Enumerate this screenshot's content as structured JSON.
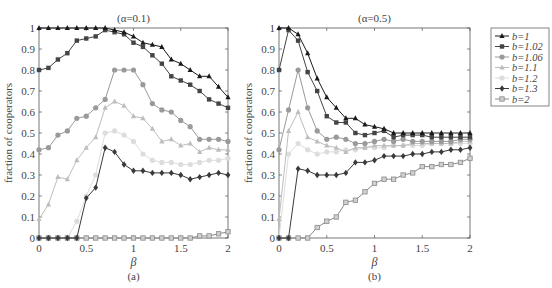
{
  "chart_data": [
    {
      "type": "line",
      "panel_label": "(a)",
      "title": "(α=0.1)",
      "xlabel": "β",
      "ylabel": "fraction of cooperators",
      "xlim": [
        0,
        2
      ],
      "ylim": [
        0,
        1
      ],
      "xticks": [
        "0",
        "0.5",
        "1",
        "1.5",
        "2"
      ],
      "yticks": [
        "0",
        "0.1",
        "0.2",
        "0.3",
        "0.4",
        "0.5",
        "0.6",
        "0.7",
        "0.8",
        "0.9",
        "1"
      ],
      "grid": false,
      "x": [
        0,
        0.1,
        0.2,
        0.3,
        0.4,
        0.5,
        0.6,
        0.7,
        0.8,
        0.9,
        1.0,
        1.1,
        1.2,
        1.3,
        1.4,
        1.5,
        1.6,
        1.7,
        1.8,
        1.9,
        2.0
      ],
      "series": [
        {
          "name": "b=1",
          "marker": "triangle",
          "color": "#1a1a1a",
          "values": [
            1,
            1,
            1,
            1,
            1,
            1,
            1,
            1,
            0.99,
            0.98,
            0.96,
            0.93,
            0.92,
            0.91,
            0.85,
            0.83,
            0.8,
            0.77,
            0.77,
            0.72,
            0.67
          ]
        },
        {
          "name": "b=1.02",
          "marker": "square",
          "color": "#444444",
          "values": [
            0.8,
            0.81,
            0.85,
            0.88,
            0.94,
            0.95,
            0.96,
            0.99,
            0.98,
            0.97,
            0.93,
            0.91,
            0.87,
            0.83,
            0.77,
            0.75,
            0.73,
            0.7,
            0.66,
            0.64,
            0.62
          ]
        },
        {
          "name": "b=1.06",
          "marker": "circle",
          "color": "#9a9a9a",
          "values": [
            0.42,
            0.43,
            0.49,
            0.51,
            0.57,
            0.58,
            0.62,
            0.66,
            0.8,
            0.8,
            0.8,
            0.73,
            0.64,
            0.61,
            0.6,
            0.56,
            0.53,
            0.47,
            0.47,
            0.47,
            0.46
          ]
        },
        {
          "name": "b=1.1",
          "marker": "triangle",
          "color": "#bdbdbd",
          "values": [
            0.09,
            0.16,
            0.29,
            0.28,
            0.37,
            0.43,
            0.48,
            0.62,
            0.65,
            0.63,
            0.58,
            0.57,
            0.52,
            0.46,
            0.47,
            0.44,
            0.45,
            0.41,
            0.43,
            0.42,
            0.42
          ]
        },
        {
          "name": "b=1.2",
          "marker": "circle",
          "color": "#dddddd",
          "values": [
            0,
            0,
            0,
            0,
            0.08,
            0.2,
            0.3,
            0.5,
            0.51,
            0.49,
            0.46,
            0.4,
            0.37,
            0.36,
            0.36,
            0.35,
            0.35,
            0.36,
            0.37,
            0.37,
            0.38
          ]
        },
        {
          "name": "b=1.3",
          "marker": "diamond",
          "color": "#3a3a3a",
          "values": [
            0,
            0,
            0,
            0,
            0,
            0.19,
            0.24,
            0.43,
            0.41,
            0.35,
            0.32,
            0.32,
            0.31,
            0.31,
            0.31,
            0.3,
            0.28,
            0.29,
            0.3,
            0.31,
            0.3
          ]
        },
        {
          "name": "b=2",
          "marker": "square-open",
          "color": "#8a8a8a",
          "values": [
            0,
            0,
            0,
            0,
            0,
            0,
            0,
            0,
            0,
            0,
            0,
            0,
            0,
            0,
            0,
            0,
            0,
            0.01,
            0.01,
            0.02,
            0.03
          ]
        }
      ]
    },
    {
      "type": "line",
      "panel_label": "(b)",
      "title": "(α=0.5)",
      "xlabel": "β",
      "ylabel": "fraction of cooperators",
      "xlim": [
        0,
        2
      ],
      "ylim": [
        0,
        1
      ],
      "xticks": [
        "0",
        "0.5",
        "1",
        "1.5",
        "2"
      ],
      "yticks": [
        "0",
        "0.1",
        "0.2",
        "0.3",
        "0.4",
        "0.5",
        "0.6",
        "0.7",
        "0.8",
        "0.9",
        "1"
      ],
      "grid": false,
      "x": [
        0,
        0.1,
        0.2,
        0.3,
        0.4,
        0.5,
        0.6,
        0.7,
        0.8,
        0.9,
        1.0,
        1.1,
        1.2,
        1.3,
        1.4,
        1.5,
        1.6,
        1.7,
        1.8,
        1.9,
        2.0
      ],
      "series": [
        {
          "name": "b=1",
          "marker": "triangle",
          "color": "#1a1a1a",
          "values": [
            1,
            1,
            0.97,
            0.88,
            0.76,
            0.67,
            0.62,
            0.57,
            0.57,
            0.54,
            0.53,
            0.52,
            0.5,
            0.5,
            0.5,
            0.5,
            0.5,
            0.5,
            0.5,
            0.5,
            0.5
          ]
        },
        {
          "name": "b=1.02",
          "marker": "square",
          "color": "#444444",
          "values": [
            0.8,
            0.99,
            0.94,
            0.79,
            0.7,
            0.58,
            0.55,
            0.55,
            0.5,
            0.49,
            0.5,
            0.51,
            0.48,
            0.49,
            0.49,
            0.49,
            0.48,
            0.48,
            0.48,
            0.48,
            0.48
          ]
        },
        {
          "name": "b=1.06",
          "marker": "circle",
          "color": "#9a9a9a",
          "values": [
            0.42,
            0.61,
            0.8,
            0.62,
            0.51,
            0.47,
            0.48,
            0.47,
            0.45,
            0.45,
            0.46,
            0.47,
            0.46,
            0.47,
            0.46,
            0.46,
            0.46,
            0.46,
            0.46,
            0.47,
            0.47
          ]
        },
        {
          "name": "b=1.1",
          "marker": "triangle",
          "color": "#bdbdbd",
          "values": [
            0.09,
            0.51,
            0.6,
            0.48,
            0.46,
            0.44,
            0.43,
            0.41,
            0.43,
            0.43,
            0.44,
            0.44,
            0.44,
            0.44,
            0.45,
            0.45,
            0.45,
            0.45,
            0.45,
            0.46,
            0.46
          ]
        },
        {
          "name": "b=1.2",
          "marker": "circle",
          "color": "#dddddd",
          "values": [
            0,
            0.4,
            0.45,
            0.42,
            0.4,
            0.41,
            0.41,
            0.42,
            0.42,
            0.43,
            0.43,
            0.43,
            0.44,
            0.44,
            0.44,
            0.44,
            0.45,
            0.45,
            0.45,
            0.45,
            0.45
          ]
        },
        {
          "name": "b=1.3",
          "marker": "diamond",
          "color": "#3a3a3a",
          "values": [
            0,
            0,
            0.33,
            0.32,
            0.3,
            0.3,
            0.3,
            0.31,
            0.36,
            0.36,
            0.37,
            0.39,
            0.39,
            0.39,
            0.4,
            0.4,
            0.41,
            0.41,
            0.42,
            0.42,
            0.43
          ]
        },
        {
          "name": "b=2",
          "marker": "square-open",
          "color": "#8a8a8a",
          "values": [
            0,
            0,
            0,
            0,
            0.05,
            0.08,
            0.1,
            0.17,
            0.18,
            0.22,
            0.26,
            0.28,
            0.28,
            0.3,
            0.31,
            0.34,
            0.34,
            0.35,
            0.35,
            0.36,
            0.38
          ]
        }
      ]
    }
  ],
  "legend": {
    "entries": [
      "b=1",
      "b=1.02",
      "b=1.06",
      "b=1.1",
      "b=1.2",
      "b=1.3",
      "b=2"
    ]
  }
}
